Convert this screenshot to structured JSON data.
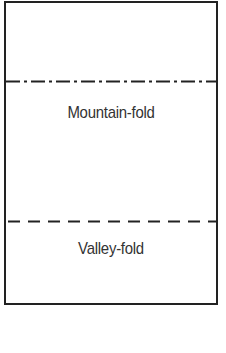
{
  "diagram": {
    "sheet": {
      "border_color": "#222222",
      "background": "#ffffff"
    },
    "fold_lines": [
      {
        "type": "mountain-fold",
        "style": "dash-dot",
        "label": "Mountain-fold"
      },
      {
        "type": "valley-fold",
        "style": "dashed",
        "label": "Valley-fold"
      }
    ],
    "text_color": "#333333"
  }
}
